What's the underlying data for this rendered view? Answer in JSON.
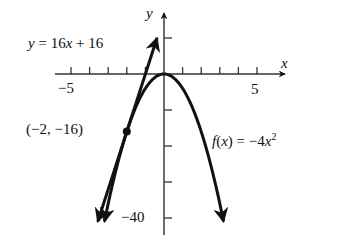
{
  "chart_data": {
    "type": "line",
    "title": "",
    "xlabel": "x",
    "ylabel": "y",
    "xlim": [
      -5.9,
      6.5
    ],
    "ylim": [
      -44,
      16.5
    ],
    "x_ticks": [
      -5,
      -4,
      -3,
      -2,
      -1,
      1,
      2,
      3,
      4,
      5
    ],
    "x_tick_labels": [
      {
        "value": -5,
        "label": "−5"
      },
      {
        "value": 5,
        "label": "5"
      }
    ],
    "y_ticks": [
      10,
      -10,
      -20,
      -30,
      -40
    ],
    "y_tick_labels": [
      {
        "value": -40,
        "label": "−40"
      }
    ],
    "grid": false,
    "series": [
      {
        "name": "f(x) = −4x²",
        "kind": "parabola",
        "equation": "f(x) = -4x^2",
        "x": [
          -3.2,
          -3,
          -2.5,
          -2,
          -1.5,
          -1,
          -0.5,
          0,
          0.5,
          1,
          1.5,
          2,
          2.5,
          3,
          3.2
        ],
        "y": [
          -40.96,
          -36,
          -25,
          -16,
          -9,
          -4,
          -1,
          0,
          -1,
          -4,
          -9,
          -16,
          -25,
          -36,
          -40.96
        ]
      },
      {
        "name": "y = 16x + 16",
        "kind": "tangent-line",
        "equation": "y = 16x + 16",
        "x": [
          -3.56,
          -0.375
        ],
        "y": [
          -41,
          10
        ]
      }
    ],
    "annotations": [
      {
        "text": "(−2, −16)",
        "x": -2,
        "y": -16,
        "marker": "point"
      },
      {
        "text": "y = 16x + 16",
        "attached_to": "tangent-line"
      },
      {
        "text": "f(x) = −4x²",
        "attached_to": "parabola"
      }
    ]
  },
  "labels": {
    "x_axis": "x",
    "y_axis": "y",
    "x_min_tick": "−5",
    "x_max_tick": "5",
    "y_min_tick": "−40",
    "point": "(−2, −16)",
    "line_eq_y": "y",
    "line_eq_rest": " = 16",
    "line_eq_x": "x",
    "line_eq_tail": " + 16",
    "curve_f": "f",
    "curve_open": "(",
    "curve_x": "x",
    "curve_close": ") = −4",
    "curve_x2": "x",
    "curve_exp": "2"
  },
  "colors": {
    "ink": "#111111",
    "background": "#ffffff"
  }
}
